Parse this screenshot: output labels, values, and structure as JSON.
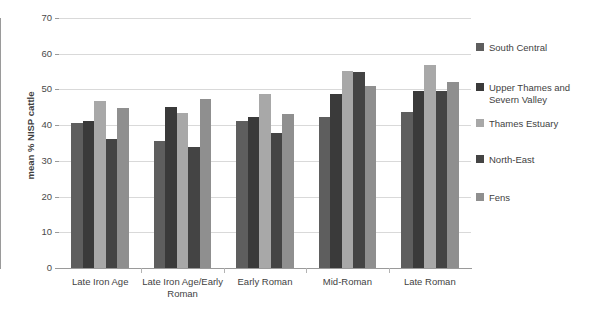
{
  "chart_data": {
    "type": "bar",
    "title": "",
    "xlabel": "",
    "ylabel": "mean % NISP cattle",
    "ylim": [
      0,
      70
    ],
    "ytick_step": 10,
    "yticks": [
      70,
      60,
      50,
      40,
      30,
      20,
      10,
      0
    ],
    "grid": true,
    "legend_position": "right",
    "categories": [
      "Late Iron Age",
      "Late Iron Age/Early Roman",
      "Early Roman",
      "Mid-Roman",
      "Late Roman"
    ],
    "series": [
      {
        "name": "South Central",
        "color": "#5e5e5e",
        "values": [
          40.5,
          35.5,
          41.3,
          42.2,
          43.6
        ]
      },
      {
        "name": "Upper Thames and Severn Valley",
        "color": "#3a3a3a",
        "values": [
          41.3,
          45.0,
          42.3,
          48.8,
          49.6
        ]
      },
      {
        "name": "Thames Estuary",
        "color": "#a8a8a8",
        "values": [
          46.7,
          43.3,
          48.6,
          55.2,
          56.8
        ]
      },
      {
        "name": "North-East",
        "color": "#444444",
        "values": [
          36.1,
          33.8,
          37.8,
          55.0,
          49.6
        ]
      },
      {
        "name": "Fens",
        "color": "#8f8f8f",
        "values": [
          44.8,
          47.4,
          43.2,
          51.1,
          52.0
        ]
      }
    ]
  },
  "legend": {
    "items": [
      {
        "label": "South Central"
      },
      {
        "label": "Upper Thames and Severn Valley"
      },
      {
        "label": "Thames Estuary"
      },
      {
        "label": "North-East"
      },
      {
        "label": "Fens"
      }
    ]
  },
  "axis": {
    "y_title": "mean % NISP cattle"
  }
}
